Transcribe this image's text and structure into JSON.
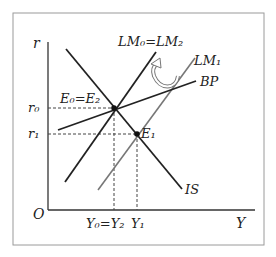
{
  "diagram": {
    "type": "IS-LM-BP",
    "axes": {
      "x_label": "Y",
      "y_label": "r",
      "origin_label": "O"
    },
    "curves": [
      {
        "id": "IS",
        "label": "IS",
        "slope": "negative",
        "color": "#222222"
      },
      {
        "id": "LM0",
        "label": "LM₀=LM₂",
        "slope": "positive",
        "color": "#222222"
      },
      {
        "id": "LM1",
        "label": "LM₁",
        "slope": "positive",
        "color": "#777777"
      },
      {
        "id": "BP",
        "label": "BP",
        "slope": "positive-flat",
        "color": "#222222"
      }
    ],
    "equilibria": [
      {
        "id": "E0",
        "label": "E₀=E₂",
        "r": "r₀",
        "y": "Y₀=Y₂"
      },
      {
        "id": "E1",
        "label": "E₁",
        "r": "r₁",
        "y": "Y₁"
      }
    ],
    "y_ticks": [
      "r₀",
      "r₁"
    ],
    "x_ticks": [
      "Y₀=Y₂",
      "Y₁"
    ],
    "arrow": {
      "from": "LM1",
      "to": "LM0",
      "meaning": "LM shifts back"
    }
  }
}
